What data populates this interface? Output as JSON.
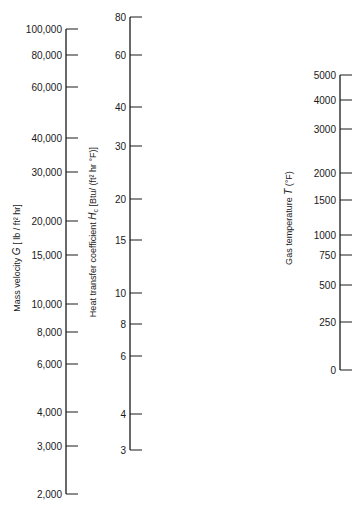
{
  "chart_data": {
    "type": "nomogram",
    "title": "",
    "axes": [
      {
        "id": "mass-velocity",
        "label": "Mass velocity  G  [ lb / ft² hr]",
        "label_parts": {
          "pre": "Mass velocity  ",
          "symbol": "G",
          "post": "  [ lb / ft² hr]"
        },
        "scale": "log",
        "range": [
          2000,
          100000
        ],
        "x": 66,
        "y_top": 29,
        "y_bottom": 494,
        "label_x": 20,
        "label_y": 258,
        "ticks": [
          {
            "value": 100000,
            "label": "100,000",
            "y": 29
          },
          {
            "value": 80000,
            "label": "80,000",
            "y": 55
          },
          {
            "value": 60000,
            "label": "60,000",
            "y": 87
          },
          {
            "value": 40000,
            "label": "40,000",
            "y": 138
          },
          {
            "value": 30000,
            "label": "30,000",
            "y": 172
          },
          {
            "value": 20000,
            "label": "20,000",
            "y": 221
          },
          {
            "value": 15000,
            "label": "15,000",
            "y": 255
          },
          {
            "value": 10000,
            "label": "10,000",
            "y": 304
          },
          {
            "value": 8000,
            "label": "8,000",
            "y": 332
          },
          {
            "value": 6000,
            "label": "6,000",
            "y": 364
          },
          {
            "value": 4000,
            "label": "4,000",
            "y": 412
          },
          {
            "value": 3000,
            "label": "3,000",
            "y": 446
          },
          {
            "value": 2000,
            "label": "2,000",
            "y": 494
          }
        ]
      },
      {
        "id": "heat-transfer-coefficient",
        "label": "Heat transfer coefficient  Hc  [Btu/ (ft² hr °F)]",
        "label_parts": {
          "pre": "Heat transfer coefficient  ",
          "symbol": "H",
          "sub": "c",
          "post": "  [Btu/ (ft² hr °F)]"
        },
        "scale": "log",
        "range": [
          3,
          80
        ],
        "x": 130,
        "y_top": 17,
        "y_bottom": 450,
        "label_x": 96,
        "label_y": 232,
        "ticks": [
          {
            "value": 80,
            "label": "80",
            "y": 17
          },
          {
            "value": 60,
            "label": "60",
            "y": 55
          },
          {
            "value": 40,
            "label": "40",
            "y": 107
          },
          {
            "value": 30,
            "label": "30",
            "y": 146
          },
          {
            "value": 20,
            "label": "20",
            "y": 199
          },
          {
            "value": 15,
            "label": "15",
            "y": 240
          },
          {
            "value": 10,
            "label": "10",
            "y": 293
          },
          {
            "value": 8,
            "label": "8",
            "y": 324
          },
          {
            "value": 6,
            "label": "6",
            "y": 356
          },
          {
            "value": 4,
            "label": "4",
            "y": 414
          },
          {
            "value": 3,
            "label": "3",
            "y": 450
          }
        ]
      },
      {
        "id": "gas-temperature",
        "label": "Gas temperature  T  (°F)",
        "label_parts": {
          "pre": "Gas temperature  ",
          "symbol": "T",
          "post": "  (°F)"
        },
        "scale": "nonlinear",
        "range": [
          0,
          5000
        ],
        "x": 340,
        "y_top": 75,
        "y_bottom": 370,
        "label_x": 292,
        "label_y": 218,
        "ticks": [
          {
            "value": 5000,
            "label": "5000",
            "y": 75
          },
          {
            "value": 4000,
            "label": "4000",
            "y": 100
          },
          {
            "value": 3000,
            "label": "3000",
            "y": 129
          },
          {
            "value": 2000,
            "label": "2000",
            "y": 173
          },
          {
            "value": 1500,
            "label": "1500",
            "y": 200
          },
          {
            "value": 1000,
            "label": "1000",
            "y": 235
          },
          {
            "value": 750,
            "label": "750",
            "y": 255
          },
          {
            "value": 500,
            "label": "500",
            "y": 285
          },
          {
            "value": 250,
            "label": "250",
            "y": 322
          },
          {
            "value": 0,
            "label": "0",
            "y": 370
          }
        ]
      }
    ],
    "grid": false,
    "legend": null
  }
}
